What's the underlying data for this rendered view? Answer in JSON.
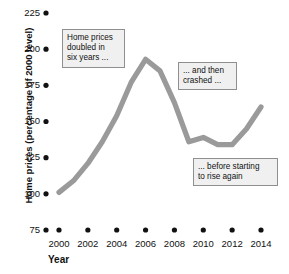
{
  "chart_data": {
    "type": "line",
    "title": "",
    "subtitle": "",
    "xlabel": "Year",
    "ylabel": "Home prices (percentage of 2000 level)",
    "xlim": [
      2000,
      2014
    ],
    "ylim": [
      75,
      225
    ],
    "grid": false,
    "legend": "none",
    "line_color": "#9a9a9a",
    "x": [
      2000,
      2001,
      2002,
      2003,
      2004,
      2005,
      2006,
      2007,
      2008,
      2009,
      2010,
      2011,
      2012,
      2013,
      2014
    ],
    "series": [
      {
        "name": "Home price index",
        "values": [
          101,
          109,
          121,
          136,
          154,
          177,
          193,
          185,
          163,
          136,
          139,
          134,
          134,
          145,
          160
        ]
      }
    ],
    "xticks": [
      2000,
      2002,
      2004,
      2006,
      2008,
      2010,
      2012,
      2014
    ],
    "xtick_labels": [
      "2000",
      "2002",
      "2004",
      "2006",
      "2008",
      "2010",
      "2012",
      "2014"
    ],
    "yticks": [
      75,
      100,
      125,
      150,
      175,
      200,
      225
    ],
    "ytick_labels": [
      "75",
      "100",
      "125",
      "150",
      "175",
      "200",
      "225"
    ],
    "annotations": [
      {
        "id": "annotation-1",
        "lines": [
          "Home prices",
          "doubled in",
          "six years ..."
        ]
      },
      {
        "id": "annotation-2",
        "lines": [
          "... and then",
          "crashed ..."
        ]
      },
      {
        "id": "annotation-3",
        "lines": [
          "... before starting",
          "to rise again"
        ]
      }
    ]
  }
}
